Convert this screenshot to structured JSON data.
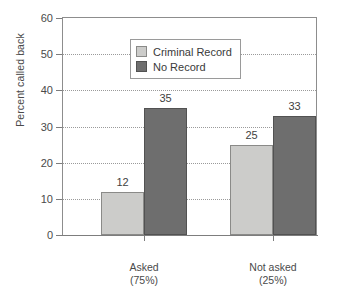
{
  "chart_data": {
    "type": "bar",
    "title": "",
    "xlabel": "",
    "ylabel": "Percent called back",
    "ylim": [
      0,
      60
    ],
    "yticks": [
      0,
      10,
      20,
      30,
      40,
      50,
      60
    ],
    "grid": true,
    "legend_position": "top-left",
    "categories": [
      "Asked",
      "Not asked"
    ],
    "category_sublabels": [
      "(75%)",
      "(25%)"
    ],
    "series": [
      {
        "name": "Criminal Record",
        "color": "#ccccca",
        "values": [
          12,
          25
        ]
      },
      {
        "name": "No Record",
        "color": "#6e6e6e",
        "values": [
          35,
          33
        ]
      }
    ]
  },
  "legend": {
    "items": [
      {
        "label": "Criminal Record"
      },
      {
        "label": "No Record"
      }
    ]
  },
  "caption": {
    "text": ""
  }
}
